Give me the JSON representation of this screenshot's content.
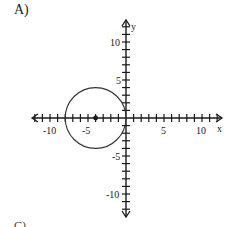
{
  "option_label": "A)",
  "next_option_label": "C)",
  "graph": {
    "x_axis_label": "x",
    "y_axis_label": "y",
    "x_tick_labels": [
      "-10",
      "-5",
      "5",
      "10"
    ],
    "y_tick_labels": [
      "10",
      "5",
      "-5",
      "-10"
    ]
  },
  "chart_data": {
    "type": "scatter",
    "title": "",
    "xlabel": "x",
    "ylabel": "y",
    "xlim": [
      -12,
      12
    ],
    "ylim": [
      -12,
      12
    ],
    "grid": false,
    "ticks_every": 1,
    "tick_labels_x": [
      -10,
      -5,
      5,
      10
    ],
    "tick_labels_y": [
      -10,
      -5,
      5,
      10
    ],
    "shapes": [
      {
        "kind": "circle",
        "center": [
          -4,
          0
        ],
        "radius": 4,
        "center_marked": true
      }
    ],
    "equation": "(x + 4)^2 + y^2 = 16"
  }
}
